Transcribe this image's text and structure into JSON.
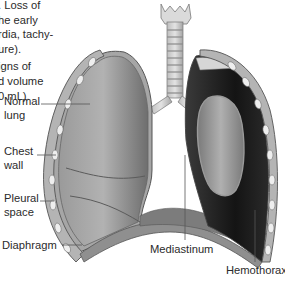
{
  "intro_text": {
    "lines": [
      ". Loss of",
      "he early",
      "rdia, tachy-",
      "ure).",
      "igns of",
      "d volume",
      "0 mL)."
    ]
  },
  "figure": {
    "labels": {
      "normal_lung": [
        "Normal",
        "lung"
      ],
      "chest_wall": [
        "Chest",
        "wall"
      ],
      "pleural_space": [
        "Pleural",
        "space"
      ],
      "diaphragm": "Diaphragm",
      "mediastinum": "Mediastinum",
      "hemothorax": "Hemothorax"
    },
    "colors": {
      "lung_gray": "#8c8c8c",
      "dark_blood": "#1e1e1e",
      "chest_wall": "#a9a9a9",
      "rib_white": "#eeeeee",
      "label_line": "#555555"
    }
  }
}
